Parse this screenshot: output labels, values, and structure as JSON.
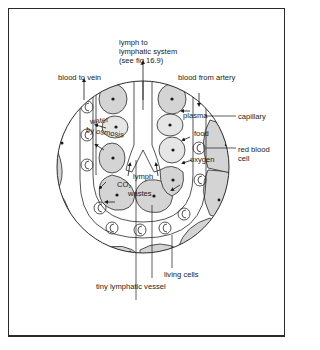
{
  "figure": {
    "type": "cross-section diagram",
    "colors": {
      "line": "#2a2a2a",
      "cell_fill": "#d4d4d4",
      "light_cell_fill": "#e6e6e6",
      "background": "#ffffff"
    }
  },
  "labels": {
    "lymph_to_system": "lymph to\nlymphatic system\n(see fig 16.9)",
    "blood_to_vein": "blood to vein",
    "blood_from_artery": "blood from artery",
    "plasma": "plasma",
    "capillary": "capillary",
    "water": "water",
    "by_osmosis": "by osmosis",
    "food": "food",
    "red_blood_cell": "red blood\ncell",
    "oxygen": "oxygen",
    "lymph": "lymph",
    "co2": "CO₂",
    "wastes": "wastes",
    "living_cells": "living cells",
    "tiny_lymphatic_vessel": "tiny lymphatic vessel"
  }
}
